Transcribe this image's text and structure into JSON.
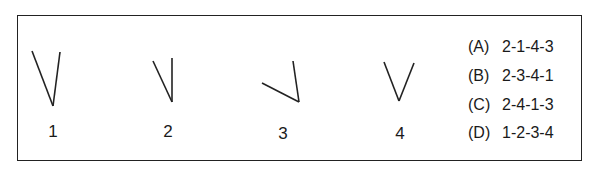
{
  "figures": [
    {
      "label": "1",
      "lines": [
        [
          32,
          51,
          53,
          106
        ],
        [
          60,
          52,
          53,
          106
        ]
      ],
      "label_pos": [
        43,
        122
      ]
    },
    {
      "label": "2",
      "lines": [
        [
          153,
          61,
          172,
          102
        ],
        [
          172,
          58,
          172,
          102
        ]
      ],
      "label_pos": [
        158,
        122
      ]
    },
    {
      "label": "3",
      "lines": [
        [
          262,
          83,
          299,
          102
        ],
        [
          293,
          61,
          299,
          102
        ]
      ],
      "label_pos": [
        273,
        124
      ]
    },
    {
      "label": "4",
      "lines": [
        [
          384,
          62,
          399,
          101
        ],
        [
          414,
          63,
          399,
          101
        ]
      ],
      "label_pos": [
        390,
        124
      ]
    }
  ],
  "options": [
    {
      "key": "(A)",
      "value": "2-1-4-3"
    },
    {
      "key": "(B)",
      "value": "2-3-4-1"
    },
    {
      "key": "(C)",
      "value": "2-4-1-3"
    },
    {
      "key": "(D)",
      "value": "1-2-3-4"
    }
  ],
  "colors": {
    "stroke": "#222222",
    "text": "#1a1a1a"
  }
}
